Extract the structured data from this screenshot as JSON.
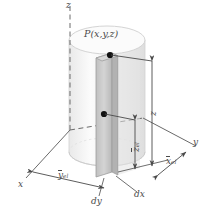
{
  "figure": {
    "type": "3d-cylinder-differential-element-diagram",
    "axes": {
      "z_axis_label": "z",
      "x_axis_label": "x",
      "y_axis_label": "y"
    },
    "point": {
      "label": "P(x,y,z)",
      "name": "point-P"
    },
    "dimensions": [
      {
        "id": "z",
        "base": "z",
        "sub": "",
        "orientation": "vertical",
        "desc": "height of point P above base"
      },
      {
        "id": "z_el",
        "base": "z",
        "sub": "el",
        "orientation": "vertical",
        "desc": "centroidal height of element"
      },
      {
        "id": "y_el",
        "base": "y",
        "sub": "el",
        "orientation": "horizontal",
        "desc": "centroidal y of element"
      },
      {
        "id": "x_el",
        "base": "x",
        "sub": "el",
        "orientation": "horizontal",
        "desc": "centroidal x of element"
      }
    ],
    "element_labels": [
      {
        "id": "dy",
        "text": "dy",
        "desc": "element depth"
      },
      {
        "id": "dx",
        "text": "dx",
        "desc": "element width"
      }
    ],
    "colors": {
      "stroke": "#4a4a4a",
      "label": "#4a4a4a",
      "cylinder_fill": "#f2f2f2",
      "cylinder_top_fill": "#fafafa",
      "element_fill": "#c9c9c9",
      "element_side_fill": "#b4b4b4",
      "dot": "#111111"
    }
  }
}
